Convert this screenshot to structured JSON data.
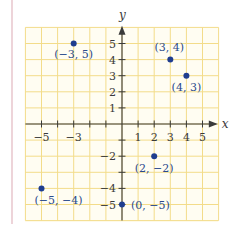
{
  "chart_data": {
    "type": "scatter",
    "title": "",
    "xlabel": "x",
    "ylabel": "y",
    "xlim": [
      -6,
      6
    ],
    "ylim": [
      -6,
      6
    ],
    "grid": true,
    "x_ticks": [
      -5,
      -3,
      1,
      2,
      3,
      4,
      5
    ],
    "x_tick_labels": [
      "−5",
      "−3",
      "1",
      "2",
      "3",
      "4",
      "5"
    ],
    "y_ticks": [
      5,
      4,
      3,
      2,
      1,
      -2,
      -4,
      -5
    ],
    "y_tick_labels": [
      "5",
      "4",
      "3",
      "2",
      "1",
      "−2",
      "−4",
      "−5"
    ],
    "points": [
      {
        "x": -3,
        "y": 5,
        "label": "(−3, 5)"
      },
      {
        "x": 3,
        "y": 4,
        "label": "(3, 4)"
      },
      {
        "x": 4,
        "y": 3,
        "label": "(4, 3)"
      },
      {
        "x": 2,
        "y": -2,
        "label": "(2, −2)"
      },
      {
        "x": -5,
        "y": -4,
        "label": "(−5, −4)"
      },
      {
        "x": 0,
        "y": -5,
        "label": "(0, −5)"
      }
    ]
  },
  "colors": {
    "grid": "#f3dc8a",
    "grid_bg": "#fffdf2",
    "axis": "#3a3a3a",
    "point": "#1f3d8f",
    "label": "#2a4a8c",
    "border": "#e2b8c0"
  }
}
